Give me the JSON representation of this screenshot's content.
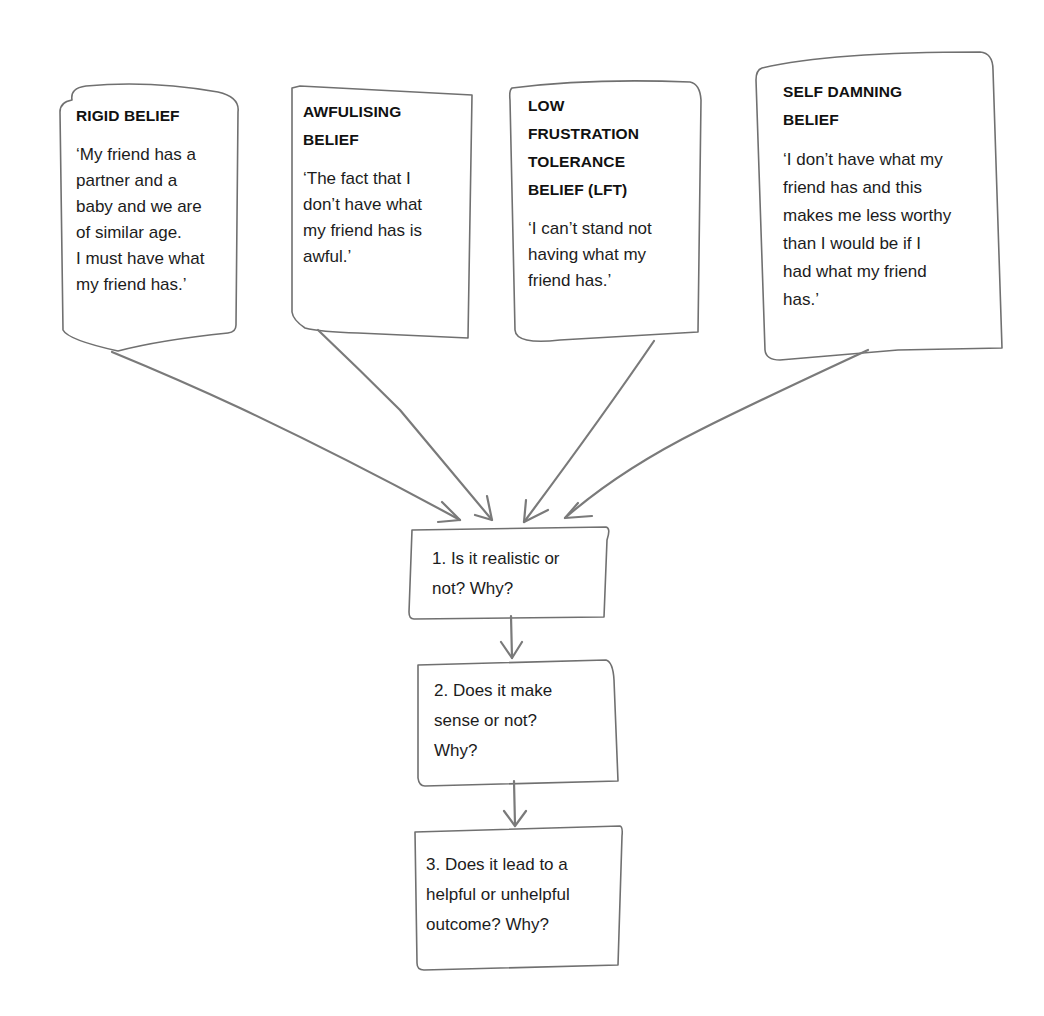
{
  "diagram": {
    "beliefs": [
      {
        "title": "RIGID BELIEF",
        "statement_lines": [
          "‘My friend has a",
          "partner and a",
          "baby and we are",
          "of similar age.",
          "I must have what",
          "my friend has.’"
        ]
      },
      {
        "title_lines": [
          "AWFULISING",
          "BELIEF"
        ],
        "statement_lines": [
          "‘The fact that I",
          "don’t have what",
          "my friend has is",
          "awful.’"
        ]
      },
      {
        "title_lines": [
          "LOW",
          "FRUSTRATION",
          "TOLERANCE",
          "BELIEF (LFT)"
        ],
        "statement_lines": [
          "‘I can’t stand not",
          "having what my",
          "friend has.’"
        ]
      },
      {
        "title_lines": [
          "SELF DAMNING",
          "BELIEF"
        ],
        "statement_lines": [
          "‘I don’t have what my",
          "friend has and this",
          "makes me less worthy",
          "than I would be if I",
          "had what my friend",
          "has.’"
        ]
      }
    ],
    "questions": [
      {
        "lines": [
          "1. Is it realistic or",
          "not? Why?"
        ]
      },
      {
        "lines": [
          "2. Does it make",
          "sense or not?",
          "Why?"
        ]
      },
      {
        "lines": [
          "3. Does it lead to a",
          "helpful or unhelpful",
          "outcome? Why?"
        ]
      }
    ],
    "colors": {
      "stroke": "#6e6e6e",
      "arrow": "#7a7a7a",
      "text": "#1a1a1a",
      "background": "#ffffff"
    }
  }
}
